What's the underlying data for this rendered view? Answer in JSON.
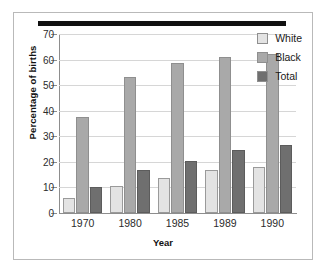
{
  "chart_data": {
    "type": "bar",
    "title": "",
    "xlabel": "Year",
    "ylabel": "Percentage of births",
    "categories": [
      "1970",
      "1980",
      "1985",
      "1989",
      "1990"
    ],
    "series": [
      {
        "name": "White",
        "color": "#e3e3e3",
        "values": [
          6,
          10.5,
          13.5,
          17,
          18
        ]
      },
      {
        "name": "Black",
        "color": "#a9a9a9",
        "values": [
          37.5,
          53,
          58.5,
          61,
          62
        ]
      },
      {
        "name": "Total",
        "color": "#6f6f6f",
        "values": [
          10,
          17,
          20.5,
          24.5,
          26.5
        ]
      }
    ],
    "ylim": [
      0,
      70
    ],
    "yticks": [
      0,
      10,
      20,
      30,
      40,
      50,
      60,
      70
    ],
    "grid": true,
    "legend_position": "top-right"
  },
  "decor": {
    "top_rule_color": "#111111",
    "frame_color": "#b9b9b9"
  }
}
